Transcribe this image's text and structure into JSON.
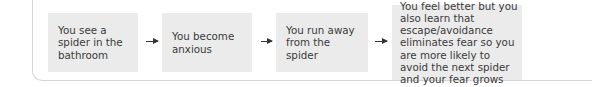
{
  "diagram": {
    "type": "flowchart",
    "steps": [
      {
        "label": "You see a spider in the bathroom"
      },
      {
        "label": "You become anxious"
      },
      {
        "label": "You run away from the spider"
      },
      {
        "label": "You feel better but you also learn that escape/avoidance eliminates fear so you are more likely to avoid the next spider and your fear grows"
      }
    ],
    "connectors": [
      "arrow-right",
      "arrow-right",
      "arrow-right"
    ],
    "colors": {
      "box_fill": "#ebebeb",
      "arrow": "#333333",
      "frame": "#d4d4d4"
    }
  }
}
